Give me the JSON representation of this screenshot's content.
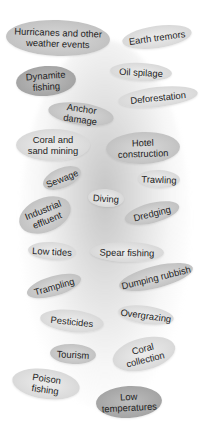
{
  "diagram": {
    "type": "threats-to-coral-reefs-cloud",
    "labels": [
      {
        "id": "hurricanes",
        "lines": [
          "Hurricanes and other",
          "weather events"
        ]
      },
      {
        "id": "earth-tremors",
        "lines": [
          "Earth tremors"
        ]
      },
      {
        "id": "dynamite-fishing",
        "lines": [
          "Dynamite",
          "fishing"
        ]
      },
      {
        "id": "oil-spilage",
        "lines": [
          "Oil spilage"
        ]
      },
      {
        "id": "deforestation",
        "lines": [
          "Deforestation"
        ]
      },
      {
        "id": "anchor-damage",
        "lines": [
          "Anchor damage"
        ]
      },
      {
        "id": "coral-sand-mining",
        "lines": [
          "Coral and",
          "sand mining"
        ]
      },
      {
        "id": "hotel-construction",
        "lines": [
          "Hotel",
          "construction"
        ]
      },
      {
        "id": "sewage",
        "lines": [
          "Sewage"
        ]
      },
      {
        "id": "trawling",
        "lines": [
          "Trawling"
        ]
      },
      {
        "id": "diving",
        "lines": [
          "Diving"
        ]
      },
      {
        "id": "industrial-effluent",
        "lines": [
          "Industrial",
          "effluent"
        ]
      },
      {
        "id": "dredging",
        "lines": [
          "Dredging"
        ]
      },
      {
        "id": "low-tides",
        "lines": [
          "Low tides"
        ]
      },
      {
        "id": "spear-fishing",
        "lines": [
          "Spear fishing"
        ]
      },
      {
        "id": "trampling",
        "lines": [
          "Trampling"
        ]
      },
      {
        "id": "dumping-rubbish",
        "lines": [
          "Dumping rubbish"
        ]
      },
      {
        "id": "pesticides",
        "lines": [
          "Pesticides"
        ]
      },
      {
        "id": "overgrazing",
        "lines": [
          "Overgrazing"
        ]
      },
      {
        "id": "tourism",
        "lines": [
          "Tourism"
        ]
      },
      {
        "id": "coral-collection",
        "lines": [
          "Coral",
          "collection"
        ]
      },
      {
        "id": "poison-fishing",
        "lines": [
          "Poison",
          "fishing"
        ]
      },
      {
        "id": "low-temperatures",
        "lines": [
          "Low",
          "temperatures"
        ]
      }
    ]
  }
}
